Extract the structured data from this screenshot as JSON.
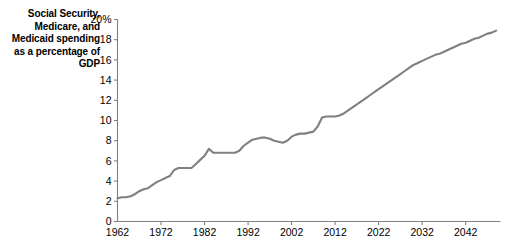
{
  "chart_data": {
    "type": "line",
    "title": "Social Security, Medicare, and Medicaid spending as a percentage of GDP",
    "xlabel": "",
    "ylabel": "",
    "xlim": [
      1962,
      2050
    ],
    "ylim": [
      0,
      20
    ],
    "grid": false,
    "legend": null,
    "line_color": "#808080",
    "axis_color": "#808080",
    "y_ticks": [
      0,
      2,
      4,
      6,
      8,
      10,
      12,
      14,
      16,
      18,
      20
    ],
    "y_tick_labels": [
      "0",
      "2",
      "4",
      "6",
      "8",
      "10",
      "12",
      "14",
      "16",
      "18",
      "20%"
    ],
    "x_ticks": [
      1962,
      1972,
      1982,
      1992,
      2002,
      2012,
      2022,
      2032,
      2042
    ],
    "x_tick_labels": [
      "1962",
      "1972",
      "1982",
      "1992",
      "2002",
      "2012",
      "2022",
      "2032",
      "2042"
    ],
    "series": [
      {
        "name": "Social Security, Medicare, and Medicaid spending",
        "x": [
          1962,
          1963,
          1964,
          1965,
          1966,
          1967,
          1968,
          1969,
          1970,
          1971,
          1972,
          1973,
          1974,
          1975,
          1976,
          1977,
          1978,
          1979,
          1980,
          1981,
          1982,
          1983,
          1984,
          1985,
          1986,
          1987,
          1988,
          1989,
          1990,
          1991,
          1992,
          1993,
          1994,
          1995,
          1996,
          1997,
          1998,
          1999,
          2000,
          2001,
          2002,
          2003,
          2004,
          2005,
          2006,
          2007,
          2008,
          2009,
          2010,
          2011,
          2012,
          2013,
          2014,
          2015,
          2016,
          2017,
          2018,
          2019,
          2020,
          2021,
          2022,
          2023,
          2024,
          2025,
          2026,
          2027,
          2028,
          2029,
          2030,
          2031,
          2032,
          2033,
          2034,
          2035,
          2036,
          2037,
          2038,
          2039,
          2040,
          2041,
          2042,
          2043,
          2044,
          2045,
          2046,
          2047,
          2048,
          2049
        ],
        "y": [
          2.3,
          2.4,
          2.4,
          2.5,
          2.7,
          3.0,
          3.2,
          3.3,
          3.6,
          3.9,
          4.1,
          4.3,
          4.5,
          5.1,
          5.3,
          5.3,
          5.3,
          5.3,
          5.7,
          6.1,
          6.5,
          7.2,
          6.8,
          6.8,
          6.8,
          6.8,
          6.8,
          6.8,
          7.0,
          7.5,
          7.8,
          8.1,
          8.2,
          8.3,
          8.3,
          8.2,
          8.0,
          7.9,
          7.8,
          8.0,
          8.4,
          8.6,
          8.7,
          8.7,
          8.8,
          8.9,
          9.4,
          10.3,
          10.4,
          10.4,
          10.4,
          10.5,
          10.7,
          11.0,
          11.3,
          11.6,
          11.9,
          12.2,
          12.5,
          12.8,
          13.1,
          13.4,
          13.7,
          14.0,
          14.3,
          14.6,
          14.9,
          15.2,
          15.5,
          15.7,
          15.9,
          16.1,
          16.3,
          16.5,
          16.6,
          16.8,
          17.0,
          17.2,
          17.4,
          17.6,
          17.7,
          17.9,
          18.1,
          18.2,
          18.4,
          18.6,
          18.7,
          18.9
        ]
      }
    ]
  }
}
